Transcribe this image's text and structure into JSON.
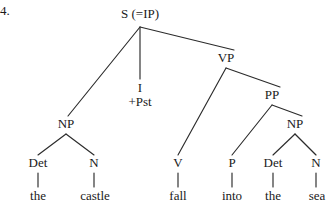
{
  "figure": {
    "item_number": "4.",
    "type": "syntax-tree",
    "sentence": "the castle fall into the sea"
  },
  "nodes": {
    "s": {
      "label": "S (=IP)",
      "x": 140,
      "y": 14
    },
    "np_subject": {
      "label": "NP",
      "x": 66,
      "y": 124
    },
    "infl": {
      "head": "I",
      "features": "+Pst",
      "x": 140,
      "y": 88
    },
    "vp": {
      "label": "VP",
      "x": 226,
      "y": 58
    },
    "pp": {
      "label": "PP",
      "x": 272,
      "y": 95
    },
    "np_object": {
      "label": "NP",
      "x": 295,
      "y": 124
    },
    "det1": {
      "label": "Det",
      "x": 38,
      "y": 163
    },
    "n1": {
      "label": "N",
      "x": 94,
      "y": 163
    },
    "v": {
      "label": "V",
      "x": 178,
      "y": 163
    },
    "p": {
      "label": "P",
      "x": 232,
      "y": 163
    },
    "det2": {
      "label": "Det",
      "x": 273,
      "y": 163
    },
    "n2": {
      "label": "N",
      "x": 316,
      "y": 163
    }
  },
  "terminals": {
    "the1": {
      "label": "the",
      "x": 38,
      "y": 196
    },
    "castle": {
      "label": "castle",
      "x": 95,
      "y": 196
    },
    "fall": {
      "label": "fall",
      "x": 178,
      "y": 196
    },
    "into": {
      "label": "into",
      "x": 232,
      "y": 196
    },
    "the2": {
      "label": "the",
      "x": 273,
      "y": 196
    },
    "sea": {
      "label": "sea",
      "x": 317,
      "y": 196
    }
  },
  "colors": {
    "ink": "#1a1a1a",
    "line": "#2b2b2b",
    "background": "#ffffff"
  }
}
